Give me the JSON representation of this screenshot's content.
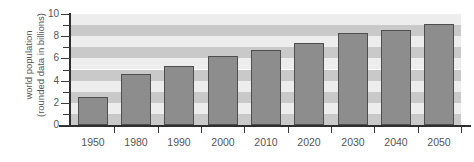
{
  "chart_data": {
    "type": "bar",
    "title": "",
    "subtitle": "",
    "xlabel": "",
    "ylabel": "world population (rounded data in billions)",
    "ylabel_lines": [
      "world population",
      "(rounded data in billions)"
    ],
    "categories": [
      "1950",
      "1980",
      "1990",
      "2000",
      "2010",
      "2020",
      "2030",
      "2040",
      "2050"
    ],
    "values": [
      2.5,
      4.6,
      5.3,
      6.2,
      6.8,
      7.4,
      8.3,
      8.6,
      9.1
    ],
    "ylim": [
      0,
      10
    ],
    "ytick_labels": [
      "0",
      "2",
      "4",
      "6",
      "8",
      "10"
    ],
    "ytick_values": [
      0,
      2,
      4,
      6,
      8,
      10
    ],
    "yminor_values": [
      1,
      3,
      5,
      7,
      9
    ],
    "grid": "horizontal-alternating-bands",
    "legend": "none",
    "bar_color": "#8d8d8d",
    "bar_border_color": "#4f4f4f",
    "band_color_dark": "#c9c9c9",
    "band_color_light": "#ededed",
    "axis_color": "#2e2e2e",
    "text_color": "#555555",
    "background": "#ffffff"
  }
}
